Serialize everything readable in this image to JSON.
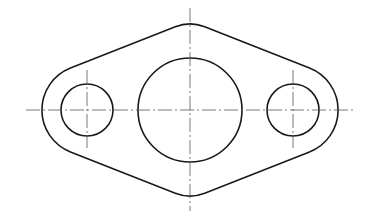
{
  "drawing": {
    "title": "Flange plate — front view",
    "type": "technical-drawing",
    "colors": {
      "outline": "#1a1a1a",
      "centerline": "#555555",
      "background": "#ffffff"
    },
    "features": {
      "outer_contour": {
        "left_lobe_center": [
          87,
          110
        ],
        "right_lobe_center": [
          293,
          110
        ],
        "lobe_radius": 45,
        "top_y": 24,
        "bottom_y": 194
      },
      "center_hole": {
        "cx": 190,
        "cy": 110,
        "r": 52
      },
      "left_hole": {
        "cx": 87,
        "cy": 110,
        "r": 26
      },
      "right_hole": {
        "cx": 293,
        "cy": 110,
        "r": 26
      },
      "centerlines": {
        "horizontal": {
          "y": 110,
          "x1": 26,
          "x2": 353
        },
        "main_vertical": {
          "x": 190,
          "y1": 8,
          "y2": 211
        },
        "left_vertical": {
          "x": 87,
          "y1": 70,
          "y2": 148
        },
        "right_vertical": {
          "x": 293,
          "y1": 70,
          "y2": 148
        }
      }
    }
  }
}
